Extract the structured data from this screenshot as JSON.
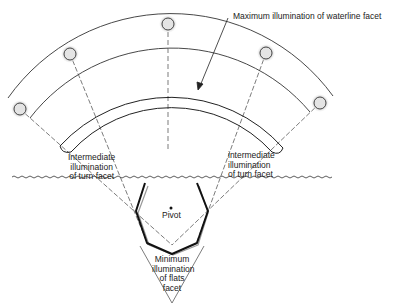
{
  "diagram": {
    "labels": {
      "max_waterline": "Maximum illumination of waterline facet",
      "pivot": "Pivot",
      "left_intermediate": [
        "Intermediate",
        "illumination",
        "of turn facet"
      ],
      "right_intermediate": [
        "intermediate",
        "illumination",
        "of turn facet"
      ],
      "minimum": [
        "Minimum",
        "illumination",
        "of flats",
        "facet"
      ]
    },
    "light_sources": [
      {
        "name": "light-1",
        "x": 20,
        "y": 109
      },
      {
        "name": "light-2",
        "x": 70,
        "y": 54
      },
      {
        "name": "light-3",
        "x": 168,
        "y": 24
      },
      {
        "name": "light-4",
        "x": 266,
        "y": 53
      },
      {
        "name": "light-5",
        "x": 320,
        "y": 103
      }
    ],
    "colors": {
      "line": "#222222",
      "source_fill": "#e4e4e4",
      "glow": "#bbbbbb"
    }
  }
}
